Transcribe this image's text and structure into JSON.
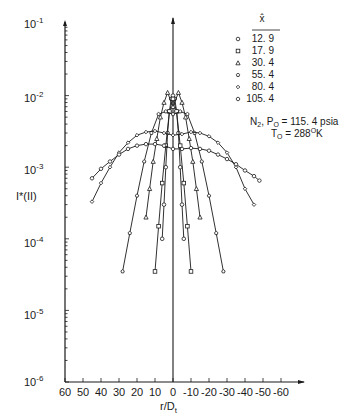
{
  "chart_data": {
    "type": "line",
    "title": "",
    "xlabel": "r/D_t",
    "ylabel": "I*(II)",
    "yscale": "log",
    "ylim": [
      1e-06,
      0.1
    ],
    "xlim": [
      60,
      -60
    ],
    "x_reversed": true,
    "grid": false,
    "legend_position": "upper right",
    "legend_title": "x̂",
    "xticks": [
      "60",
      "50",
      "40",
      "30",
      "20",
      "10",
      "0",
      "-10",
      "-20",
      "-30",
      "-40",
      "-50",
      "-60"
    ],
    "yticks": [
      "10^-6",
      "10^-5",
      "10^-4",
      "10^-3",
      "10^-2",
      "10^-1"
    ],
    "annotation": [
      "N2,  P0 = 115.4 psia",
      "T0 = 288°K"
    ],
    "series": [
      {
        "name": "12.9",
        "marker": "circle",
        "x": [
          6,
          5,
          4,
          3,
          2,
          1,
          0,
          -1,
          -2,
          -3,
          -4,
          -5,
          -6
        ],
        "y": [
          0.0001,
          0.0003,
          0.001,
          0.003,
          0.006,
          0.009,
          0.01,
          0.009,
          0.006,
          0.003,
          0.001,
          0.0003,
          0.0001
        ]
      },
      {
        "name": "17.9",
        "marker": "square",
        "x": [
          10,
          8,
          6,
          4,
          2,
          0,
          -2,
          -4,
          -6,
          -8,
          -10
        ],
        "y": [
          3.5e-05,
          0.00015,
          0.0006,
          0.002,
          0.006,
          0.009,
          0.006,
          0.002,
          0.0006,
          0.00015,
          3.5e-05
        ]
      },
      {
        "name": "30.4",
        "marker": "triangle",
        "x": [
          15,
          13,
          11,
          9,
          7,
          5,
          3,
          0,
          -3,
          -5,
          -7,
          -9,
          -11,
          -13,
          -15
        ],
        "y": [
          0.0002,
          0.0005,
          0.0012,
          0.0025,
          0.005,
          0.008,
          0.011,
          0.007,
          0.011,
          0.008,
          0.005,
          0.0025,
          0.0012,
          0.0005,
          0.0002
        ]
      },
      {
        "name": "55.4",
        "marker": "pentagon",
        "x": [
          28,
          24,
          20,
          16,
          12,
          8,
          4,
          0,
          -4,
          -8,
          -12,
          -16,
          -20,
          -24,
          -28
        ],
        "y": [
          3.5e-05,
          0.00012,
          0.0004,
          0.0012,
          0.003,
          0.0055,
          0.006,
          0.0055,
          0.006,
          0.0055,
          0.003,
          0.0012,
          0.0004,
          0.00012,
          3.5e-05
        ]
      },
      {
        "name": "80.4",
        "marker": "diamond",
        "x": [
          45,
          40,
          35,
          30,
          25,
          20,
          15,
          10,
          5,
          0,
          -5,
          -10,
          -15,
          -20,
          -25,
          -30,
          -35,
          -40,
          -45
        ],
        "y": [
          0.00033,
          0.0006,
          0.001,
          0.0016,
          0.0022,
          0.0028,
          0.0031,
          0.0032,
          0.003,
          0.0028,
          0.0029,
          0.0031,
          0.003,
          0.0027,
          0.0022,
          0.0016,
          0.001,
          0.0005,
          0.0003
        ]
      },
      {
        "name": "105.4",
        "marker": "octagon",
        "x": [
          45,
          40,
          35,
          30,
          25,
          20,
          15,
          10,
          5,
          0,
          -5,
          -10,
          -15,
          -20,
          -25,
          -30,
          -35,
          -40,
          -45,
          -48
        ],
        "y": [
          0.0007,
          0.00095,
          0.0012,
          0.0015,
          0.0018,
          0.002,
          0.0021,
          0.0021,
          0.002,
          0.0018,
          0.0018,
          0.00185,
          0.0018,
          0.0017,
          0.0015,
          0.0013,
          0.0011,
          0.0009,
          0.00075,
          0.00065
        ]
      }
    ]
  },
  "legend": {
    "title": "x̂",
    "items": [
      {
        "symbol": "○",
        "label": "12. 9"
      },
      {
        "symbol": "□",
        "label": "17. 9"
      },
      {
        "symbol": "△",
        "label": "30. 4"
      },
      {
        "symbol": "⬠",
        "label": "55. 4"
      },
      {
        "symbol": "◇",
        "label": "80. 4"
      },
      {
        "symbol": "⬡",
        "label": "105. 4"
      }
    ]
  },
  "annotation": {
    "line1_prefix": "N",
    "line1_sub": "2",
    "line1_mid": ",  P",
    "line1_sub2": "O",
    "line1_rest": " = 115. 4 psia",
    "line2_prefix": "T",
    "line2_sub": "O",
    "line2_rest": " = 288",
    "line2_sup": "O",
    "line2_unit": "K"
  },
  "axes": {
    "ylabel": "I*(II)",
    "xlabel_main": "r/D",
    "xlabel_sub": "t",
    "ytick_base": "10",
    "ytick_exps": [
      "-1",
      "-2",
      "-3",
      "-4",
      "-5",
      "-6"
    ]
  }
}
